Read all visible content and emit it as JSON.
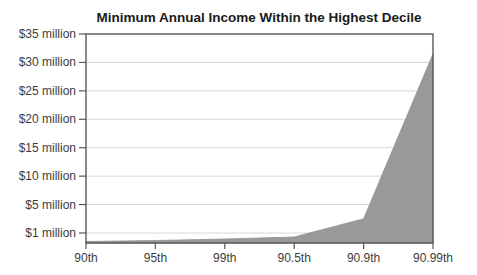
{
  "title": "Minimum Annual Income Within the Highest Decile",
  "colors": {
    "area_fill": "#999999",
    "area_edge": "#8f8f8f",
    "frame": "#58585a",
    "gridline": "#d8d8d8",
    "tick": "#58585a",
    "label_text": "#3d3d3d",
    "title_text": "#1a1a1a",
    "background": "#ffffff"
  },
  "chart_data": {
    "type": "area",
    "title": "Minimum Annual Income Within the Highest Decile",
    "categories": [
      "90th",
      "95th",
      "99th",
      "90.5th",
      "90.9th",
      "90.99th"
    ],
    "series": [
      {
        "name": "Minimum annual income",
        "values": [
          0.15,
          0.25,
          0.4,
          0.6,
          3,
          31.5
        ],
        "unit": "million USD"
      }
    ],
    "y_axis": {
      "tick_labels": [
        "$35 million",
        "$30 million",
        "$25 million",
        "$20 million",
        "$15 million",
        "$10 million",
        "$5 million",
        "$1 million"
      ],
      "tick_values": [
        35,
        30,
        25,
        20,
        15,
        10,
        5,
        1
      ],
      "baseline_value": 0,
      "note": "ticks are evenly spaced on screen although increments are uneven (1M then 5M steps)"
    },
    "x_axis": {
      "tick_labels": [
        "90th",
        "95th",
        "99th",
        "90.5th",
        "90.9th",
        "90.99th"
      ]
    },
    "grid": true,
    "legend": false
  }
}
